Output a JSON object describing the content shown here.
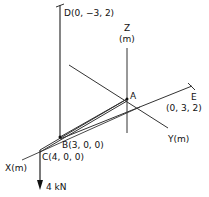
{
  "diagram": {
    "points": {
      "D": {
        "label": "D(0, −3, 2)"
      },
      "A": {
        "label": "A"
      },
      "E": {
        "label": "E",
        "coords": "(0, 3, 2)"
      },
      "B": {
        "label": "B(3, 0, 0)"
      },
      "C": {
        "label": "C(4, 0, 0)"
      }
    },
    "axes": {
      "z_label": "Z",
      "z_unit": "(m)",
      "y_label": "Y(m)",
      "x_label": "X(m)"
    },
    "load": {
      "label": "4 kN"
    },
    "colors": {
      "line": "#222222",
      "background": "#ffffff"
    }
  }
}
